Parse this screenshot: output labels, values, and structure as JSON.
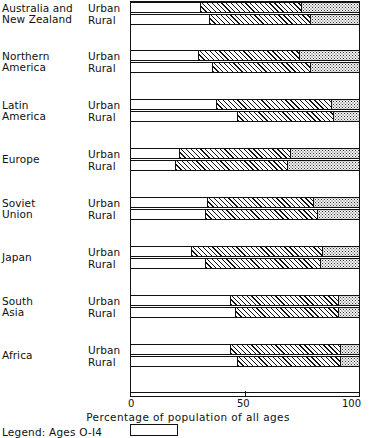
{
  "chart_data": {
    "type": "bar",
    "subtype": "stacked-horizontal",
    "title": "",
    "xlabel": "Percentage of population of all ages",
    "ylabel": "",
    "xlim": [
      0,
      100
    ],
    "xticks": [
      0,
      50,
      100
    ],
    "xticklabels": [
      "0",
      "50",
      "100"
    ],
    "grid": false,
    "legend_position": "bottom-left",
    "series": [
      {
        "name": "Ages 0-14",
        "pattern": "white",
        "color": "#ffffff"
      },
      {
        "name": "Ages 15-64",
        "pattern": "diagonal-hatch",
        "color": "#ffffff"
      },
      {
        "name": "Ages 65+",
        "pattern": "stipple",
        "color": "#f2f2f2"
      }
    ],
    "categories": [
      "Australia and New Zealand",
      "Northern America",
      "Latin America",
      "Europe",
      "Soviet Union",
      "Japan",
      "South Asia",
      "Africa"
    ],
    "groups": [
      {
        "region": "Australia and New Zealand",
        "region_lines": [
          "Australia and",
          "New Zealand"
        ],
        "bars": [
          {
            "label": "Urban",
            "values": [
              30,
              44,
              26
            ]
          },
          {
            "label": "Rural",
            "values": [
              34,
              44,
              22
            ]
          }
        ]
      },
      {
        "region": "Northern America",
        "region_lines": [
          "Northern",
          "America"
        ],
        "bars": [
          {
            "label": "Urban",
            "values": [
              29,
              44,
              27
            ]
          },
          {
            "label": "Rural",
            "values": [
              35,
              43,
              22
            ]
          }
        ]
      },
      {
        "region": "Latin America",
        "region_lines": [
          "Latin",
          "America"
        ],
        "bars": [
          {
            "label": "Urban",
            "values": [
              37,
              50,
              13
            ]
          },
          {
            "label": "Rural",
            "values": [
              46,
              42,
              12
            ]
          }
        ]
      },
      {
        "region": "Europe",
        "region_lines": [
          "Europe"
        ],
        "bars": [
          {
            "label": "Urban",
            "values": [
              21,
              48,
              31
            ]
          },
          {
            "label": "Rural",
            "values": [
              19,
              49,
              32
            ]
          }
        ]
      },
      {
        "region": "Soviet Union",
        "region_lines": [
          "Soviet",
          "Union"
        ],
        "bars": [
          {
            "label": "Urban",
            "values": [
              33,
              46,
              21
            ]
          },
          {
            "label": "Rural",
            "values": [
              32,
              49,
              19
            ]
          }
        ]
      },
      {
        "region": "Japan",
        "region_lines": [
          "Japan"
        ],
        "bars": [
          {
            "label": "Urban",
            "values": [
              26,
              57,
              17
            ]
          },
          {
            "label": "Rural",
            "values": [
              32,
              50,
              18
            ]
          }
        ]
      },
      {
        "region": "South Asia",
        "region_lines": [
          "South",
          "Asia"
        ],
        "bars": [
          {
            "label": "Urban",
            "values": [
              43,
              47,
              10
            ]
          },
          {
            "label": "Rural",
            "values": [
              45,
              45,
              10
            ]
          }
        ]
      },
      {
        "region": "Africa",
        "region_lines": [
          "Africa"
        ],
        "bars": [
          {
            "label": "Urban",
            "values": [
              43,
              48,
              9
            ]
          },
          {
            "label": "Rural",
            "values": [
              46,
              45,
              9
            ]
          }
        ]
      }
    ]
  },
  "axis": {
    "ticklabels": [
      "0",
      "50",
      "100"
    ],
    "xlabel": "Percentage of population of all ages"
  },
  "legend": {
    "text": "Legend: Ages O-I4",
    "swatch_name": "ages-0-14-swatch"
  }
}
